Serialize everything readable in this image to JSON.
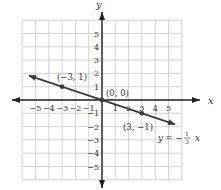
{
  "chart_data": {
    "type": "line",
    "title": "",
    "xlabel": "x",
    "ylabel": "y",
    "xlim": [
      -6,
      6
    ],
    "ylim": [
      -6,
      6
    ],
    "grid": true,
    "x_ticks": [
      "-5",
      "-4",
      "-3",
      "-2",
      "-1",
      "1",
      "2",
      "3",
      "4",
      "5"
    ],
    "y_ticks": [
      "5",
      "4",
      "3",
      "2",
      "1",
      "-1",
      "-2",
      "-3",
      "-4",
      "-5"
    ],
    "series": [
      {
        "name": "y = -1/3 x",
        "x": [
          -5.5,
          5.5
        ],
        "y": [
          1.833,
          -1.833
        ]
      }
    ],
    "points": [
      {
        "x": -3,
        "y": 1,
        "label": "(-3, 1)"
      },
      {
        "x": 0,
        "y": 0,
        "label": "(0, 0)"
      },
      {
        "x": 3,
        "y": -1,
        "label": "(3, -1)"
      }
    ],
    "annotations": {
      "equation_prefix": "y = −",
      "frac_num": "1",
      "frac_den": "3",
      "equation_suffix": "x"
    }
  },
  "labels": {
    "x_axis": "x",
    "y_axis": "y",
    "p1": "(−3, 1)",
    "p2": "(0, 0)",
    "p3": "(3, −1)"
  }
}
